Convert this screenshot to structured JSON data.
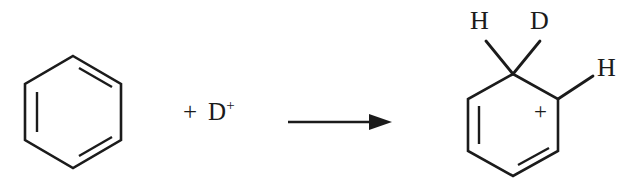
{
  "figure": {
    "kind": "chemical-reaction-scheme",
    "background_color": "#ffffff",
    "ink_color": "#1b1b1b"
  },
  "reactants": {
    "benzene": {
      "name": "benzene",
      "notation": "skeletal-hexagon",
      "double_bond_count": 3,
      "double_bond_sides": [
        "upper-right",
        "left",
        "lower-right"
      ],
      "center": {
        "x": 73,
        "y": 112
      },
      "radius": 56,
      "orientation": "pointy-top"
    },
    "plus_operator": "+",
    "electrophile": {
      "symbol": "D",
      "charge": "+",
      "full_label": "D+"
    }
  },
  "arrow": {
    "type": "reaction-arrow",
    "direction": "right",
    "shaft_start_x": 288,
    "shaft_end_x": 374,
    "y": 122,
    "head_tip_x": 392
  },
  "product": {
    "name": "arenium ion (benzenonium / cyclohexadienyl cation)",
    "notation": "skeletal-hexagon",
    "double_bond_count": 2,
    "double_bond_sides": [
      "left",
      "lower-right"
    ],
    "center": {
      "x": 513,
      "y": 125
    },
    "radius": 52,
    "orientation": "pointy-top",
    "sp3_carbon": {
      "x": 513,
      "y": 74
    },
    "cationic_carbon": {
      "x": 558,
      "y": 99
    },
    "charge_label": "+",
    "substituents": [
      {
        "label": "H",
        "attached_to": "sp3-carbon",
        "direction": "up-left"
      },
      {
        "label": "D",
        "attached_to": "sp3-carbon",
        "direction": "up-right"
      },
      {
        "label": "H",
        "attached_to": "cationic-carbon",
        "direction": "up-right"
      }
    ]
  }
}
